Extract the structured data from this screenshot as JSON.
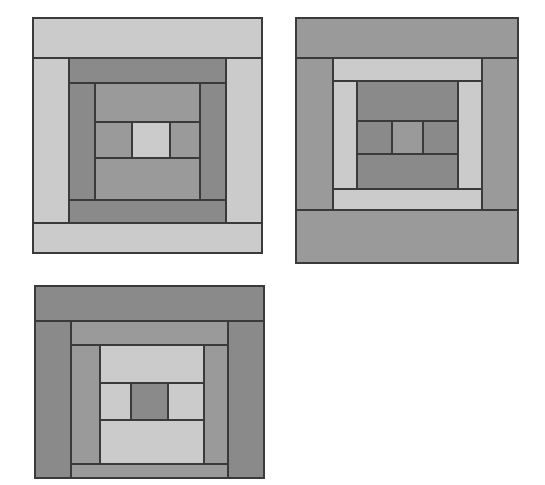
{
  "figure": {
    "type": "quilt-block-diagram",
    "background_color": "#ffffff",
    "outline_color": "#3a3a3a",
    "outline_width": 1.1,
    "canvas": {
      "width": 545,
      "height": 485
    },
    "palette": {
      "light": "#cbcbcb",
      "medium": "#9a9a9a",
      "dark": "#8a8a8a",
      "darkest": "#848484"
    },
    "block_count": 3
  },
  "blocks": [
    {
      "name": "block-top-left",
      "label": "Block 1",
      "x": 33,
      "y": 18,
      "width": 229,
      "height": 235,
      "description": "Light outer ring, dark middle ring, medium inner ring, light center",
      "pieces": [
        {
          "name": "outer-top-strip",
          "x": 33,
          "y": 18,
          "w": 229,
          "h": 40,
          "fill": "#cbcbcb"
        },
        {
          "name": "outer-left-strip",
          "x": 33,
          "y": 58,
          "w": 36,
          "h": 165,
          "fill": "#cbcbcb"
        },
        {
          "name": "outer-right-strip",
          "x": 226,
          "y": 58,
          "w": 36,
          "h": 165,
          "fill": "#cbcbcb"
        },
        {
          "name": "outer-bottom-strip",
          "x": 33,
          "y": 223,
          "w": 229,
          "h": 30,
          "fill": "#cbcbcb"
        },
        {
          "name": "ring2-top-strip",
          "x": 69,
          "y": 58,
          "w": 157,
          "h": 25,
          "fill": "#8a8a8a"
        },
        {
          "name": "ring2-left-strip",
          "x": 69,
          "y": 83,
          "w": 26,
          "h": 117,
          "fill": "#8a8a8a"
        },
        {
          "name": "ring2-right-strip",
          "x": 200,
          "y": 83,
          "w": 26,
          "h": 117,
          "fill": "#8a8a8a"
        },
        {
          "name": "ring2-bottom-strip",
          "x": 69,
          "y": 200,
          "w": 157,
          "h": 23,
          "fill": "#8a8a8a"
        },
        {
          "name": "ring3-top-strip",
          "x": 95,
          "y": 83,
          "w": 105,
          "h": 39,
          "fill": "#9a9a9a"
        },
        {
          "name": "ring3-left-strip",
          "x": 95,
          "y": 122,
          "w": 37,
          "h": 36,
          "fill": "#9a9a9a"
        },
        {
          "name": "ring3-right-strip",
          "x": 170,
          "y": 122,
          "w": 30,
          "h": 36,
          "fill": "#9a9a9a"
        },
        {
          "name": "ring3-bottom-strip",
          "x": 95,
          "y": 158,
          "w": 105,
          "h": 42,
          "fill": "#9a9a9a"
        },
        {
          "name": "center-square",
          "x": 132,
          "y": 122,
          "w": 38,
          "h": 36,
          "fill": "#cbcbcb"
        }
      ]
    },
    {
      "name": "block-top-right",
      "label": "Block 2",
      "x": 296,
      "y": 18,
      "width": 222,
      "height": 245,
      "description": "Dark outer ring, light middle ring, medium inner ring, medium center",
      "pieces": [
        {
          "name": "outer-top-strip",
          "x": 296,
          "y": 18,
          "w": 222,
          "h": 40,
          "fill": "#9a9a9a"
        },
        {
          "name": "outer-left-strip",
          "x": 296,
          "y": 58,
          "w": 37,
          "h": 152,
          "fill": "#9a9a9a"
        },
        {
          "name": "outer-right-strip",
          "x": 482,
          "y": 58,
          "w": 36,
          "h": 152,
          "fill": "#9a9a9a"
        },
        {
          "name": "outer-bottom-strip",
          "x": 296,
          "y": 210,
          "w": 222,
          "h": 53,
          "fill": "#9a9a9a"
        },
        {
          "name": "ring2-top-strip",
          "x": 333,
          "y": 58,
          "w": 149,
          "h": 23,
          "fill": "#cbcbcb"
        },
        {
          "name": "ring2-left-strip",
          "x": 333,
          "y": 81,
          "w": 24,
          "h": 108,
          "fill": "#cbcbcb"
        },
        {
          "name": "ring2-right-strip",
          "x": 458,
          "y": 81,
          "w": 24,
          "h": 108,
          "fill": "#cbcbcb"
        },
        {
          "name": "ring2-bottom-strip",
          "x": 333,
          "y": 189,
          "w": 149,
          "h": 21,
          "fill": "#cbcbcb"
        },
        {
          "name": "ring3-top-strip",
          "x": 357,
          "y": 81,
          "w": 101,
          "h": 40,
          "fill": "#8a8a8a"
        },
        {
          "name": "ring3-left-strip",
          "x": 357,
          "y": 121,
          "w": 35,
          "h": 33,
          "fill": "#8a8a8a"
        },
        {
          "name": "ring3-right-strip",
          "x": 423,
          "y": 121,
          "w": 35,
          "h": 33,
          "fill": "#8a8a8a"
        },
        {
          "name": "ring3-bottom-strip",
          "x": 357,
          "y": 154,
          "w": 101,
          "h": 35,
          "fill": "#8a8a8a"
        },
        {
          "name": "center-square",
          "x": 392,
          "y": 121,
          "w": 31,
          "h": 33,
          "fill": "#9a9a9a"
        }
      ]
    },
    {
      "name": "block-bottom-left",
      "label": "Block 3",
      "x": 35,
      "y": 286,
      "width": 229,
      "height": 192,
      "description": "Dark outer ring, medium middle ring, light inner ring, dark center",
      "pieces": [
        {
          "name": "outer-top-strip",
          "x": 35,
          "y": 286,
          "w": 229,
          "h": 35,
          "fill": "#8a8a8a"
        },
        {
          "name": "outer-left-strip",
          "x": 35,
          "y": 321,
          "w": 36,
          "h": 157,
          "fill": "#8a8a8a"
        },
        {
          "name": "outer-right-strip",
          "x": 228,
          "y": 321,
          "w": 36,
          "h": 157,
          "fill": "#8a8a8a"
        },
        {
          "name": "ring2-top-strip",
          "x": 71,
          "y": 321,
          "w": 157,
          "h": 24,
          "fill": "#9a9a9a"
        },
        {
          "name": "ring2-left-strip",
          "x": 71,
          "y": 345,
          "w": 29,
          "h": 119,
          "fill": "#9a9a9a"
        },
        {
          "name": "ring2-right-strip",
          "x": 204,
          "y": 345,
          "w": 24,
          "h": 119,
          "fill": "#9a9a9a"
        },
        {
          "name": "ring2-bottom-strip",
          "x": 71,
          "y": 464,
          "w": 157,
          "h": 14,
          "fill": "#9a9a9a"
        },
        {
          "name": "ring3-top-strip",
          "x": 100,
          "y": 345,
          "w": 104,
          "h": 38,
          "fill": "#cbcbcb"
        },
        {
          "name": "ring3-left-strip",
          "x": 100,
          "y": 383,
          "w": 31,
          "h": 37,
          "fill": "#cbcbcb"
        },
        {
          "name": "ring3-right-strip",
          "x": 168,
          "y": 383,
          "w": 36,
          "h": 37,
          "fill": "#cbcbcb"
        },
        {
          "name": "ring3-bottom-strip",
          "x": 100,
          "y": 420,
          "w": 104,
          "h": 44,
          "fill": "#cbcbcb"
        },
        {
          "name": "center-square",
          "x": 131,
          "y": 383,
          "w": 37,
          "h": 37,
          "fill": "#8a8a8a"
        }
      ]
    }
  ]
}
